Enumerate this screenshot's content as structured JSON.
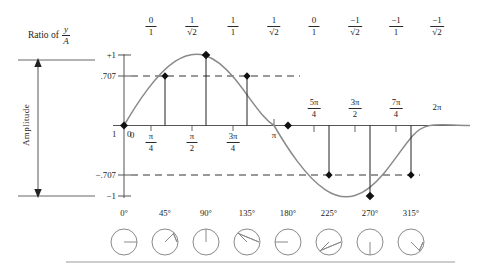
{
  "figure": {
    "title_ratio": "Ratio of",
    "ratio_numerator": "y",
    "ratio_denominator": "A",
    "amplitude_label": "Amplitude"
  },
  "ratio_row": [
    {
      "num": "0",
      "den": "1",
      "x": 151
    },
    {
      "num": "1",
      "den": "√2",
      "x": 192
    },
    {
      "num": "1",
      "den": "1",
      "x": 233
    },
    {
      "num": "1",
      "den": "√2",
      "x": 274
    },
    {
      "num": "0",
      "den": "1",
      "x": 314
    },
    {
      "num": "−1",
      "den": "√2",
      "x": 355
    },
    {
      "num": "−1",
      "den": "1",
      "x": 396
    },
    {
      "num": "−1",
      "den": "√2",
      "x": 437
    }
  ],
  "y_axis": {
    "ticks": [
      {
        "label": "+1",
        "y": 55
      },
      {
        "label": ".707",
        "y": 76
      },
      {
        "label": "−.707",
        "y": 175
      },
      {
        "label": "−1",
        "y": 196
      }
    ],
    "origin_left_label": "1",
    "origin_right_label": "0"
  },
  "x_axis": {
    "ticks": [
      {
        "label": "0",
        "kind": "plain",
        "x": 124
      },
      {
        "label": "π",
        "den": "4",
        "kind": "frac",
        "x": 151
      },
      {
        "label": "π",
        "den": "2",
        "kind": "frac",
        "x": 192
      },
      {
        "label": "3π",
        "den": "4",
        "kind": "frac",
        "x": 233
      },
      {
        "label": "π",
        "kind": "plain",
        "x": 274
      },
      {
        "label": "5π",
        "den": "4",
        "kind": "frac",
        "x": 314
      },
      {
        "label": "3π",
        "den": "2",
        "kind": "frac",
        "x": 355
      },
      {
        "label": "7π",
        "den": "4",
        "kind": "frac",
        "x": 396
      },
      {
        "label": "2π",
        "kind": "plain",
        "x": 437
      }
    ]
  },
  "degree_row": [
    {
      "label": "0°",
      "x": 124,
      "angle": 0
    },
    {
      "label": "45°",
      "x": 165,
      "angle": 45
    },
    {
      "label": "90°",
      "x": 206,
      "angle": 90
    },
    {
      "label": "135°",
      "x": 247,
      "angle": 135
    },
    {
      "label": "180°",
      "x": 288,
      "angle": 180
    },
    {
      "label": "225°",
      "x": 329,
      "angle": 225
    },
    {
      "label": "270°",
      "x": 370,
      "angle": 270
    },
    {
      "label": "315°",
      "x": 411,
      "angle": 315
    }
  ],
  "chart_data": {
    "type": "line",
    "xlabel": "Phase angle (radians / degrees)",
    "ylabel": "Amplitude",
    "xlim": [
      0,
      6.2831853
    ],
    "ylim": [
      -1,
      1
    ],
    "grid": false,
    "legend": "none",
    "x_tick_labels": [
      "0",
      "π/4",
      "π/2",
      "3π/4",
      "π",
      "5π/4",
      "3π/2",
      "7π/4",
      "2π"
    ],
    "x_tick_degrees": [
      0,
      45,
      90,
      135,
      180,
      225,
      270,
      315,
      360
    ],
    "y_tick_labels": [
      "+1",
      ".707",
      "0",
      "−.707",
      "−1"
    ],
    "y_tick_values": [
      1,
      0.707,
      0,
      -0.707,
      -1
    ],
    "series": [
      {
        "name": "sin(θ)",
        "x": [
          0,
          0.7853982,
          1.5707963,
          2.3561945,
          3.1415927,
          3.9269908,
          4.712389,
          5.4977871,
          6.2831853
        ],
        "values": [
          0,
          0.707,
          1,
          0.707,
          0,
          -0.707,
          -1,
          -0.707,
          0
        ],
        "ratio_labels": [
          "0/1",
          "1/√2",
          "1/1",
          "1/√2",
          "0/1",
          "−1/√2",
          "−1/1",
          "−1/√2",
          "0/1"
        ]
      }
    ],
    "markers": [
      {
        "x": 0,
        "y": 0,
        "marker": "diamond"
      },
      {
        "x": 0.7853982,
        "y": 0.707,
        "marker": "diamond"
      },
      {
        "x": 1.5707963,
        "y": 1,
        "marker": "diamond"
      },
      {
        "x": 2.3561945,
        "y": 0.707,
        "marker": "diamond"
      },
      {
        "x": 3.1415927,
        "y": 0,
        "marker": "diamond"
      },
      {
        "x": 3.9269908,
        "y": -0.707,
        "marker": "diamond"
      },
      {
        "x": 4.712389,
        "y": -1,
        "marker": "diamond"
      },
      {
        "x": 5.4977871,
        "y": -0.707,
        "marker": "diamond"
      }
    ],
    "reference_lines": [
      {
        "y": 0.707,
        "style": "dashed"
      },
      {
        "y": -0.707,
        "style": "dashed"
      }
    ],
    "annotations": {
      "amplitude_bracket": "Amplitude",
      "ratio_header": "Ratio of y/A"
    }
  },
  "colors": {
    "curve": "#8a8a8a",
    "axis": "#555555",
    "marker": "#111111",
    "text": "#262626",
    "dashed": "#333333",
    "circle": "#8a8a8a"
  }
}
